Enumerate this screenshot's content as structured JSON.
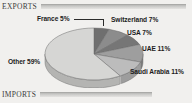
{
  "sections": {
    "exports": {
      "label": "EXPORTS"
    },
    "imports": {
      "label": "IMPORTS"
    }
  },
  "colors": {
    "background": "#f1f0ee",
    "rule": "#cfcfcd",
    "label_text": "#1c1c1c",
    "header_text": "#3b3b3b"
  },
  "chart_data": {
    "type": "pie",
    "title": "EXPORTS",
    "xlabel": "",
    "ylabel": "",
    "grid": false,
    "legend_position": "callout-labels",
    "three_d": true,
    "start_angle_deg": 0,
    "direction": "clockwise",
    "unit": "%",
    "categories": [
      "France",
      "Switzerland",
      "USA",
      "UAE",
      "Saudi Arabia",
      "Other"
    ],
    "values": [
      5,
      7,
      7,
      11,
      11,
      59
    ],
    "labels": [
      "France 5%",
      "Switzerland 7%",
      "USA 7%",
      "UAE 11%",
      "Saudi Arabia 11%",
      "Other 59%"
    ],
    "slice_colors": [
      "#6f6f6f",
      "#8c8c8c",
      "#767676",
      "#9e9e9e",
      "#bcbcbc",
      "#d6d6d4"
    ],
    "slice_side_colors": [
      "#5a5a5a",
      "#747474",
      "#616161",
      "#848484",
      "#9d9d9d",
      "#b4b4b2"
    ]
  }
}
